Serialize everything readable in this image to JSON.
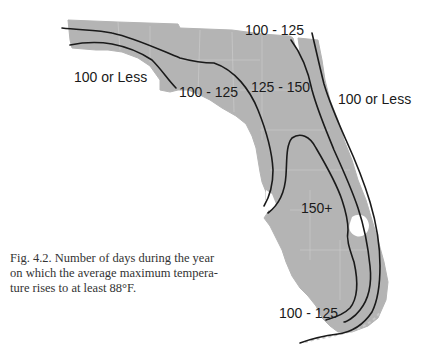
{
  "figure": {
    "caption": "Fig. 4.2. Number of days during the year on which the average maximum temperature rises to at least 88°F.",
    "caption_lines": [
      "Fig. 4.2. Number of days during the year",
      "on which the average maximum tempera-",
      "ture rises to at least 88°F."
    ]
  },
  "map": {
    "region": "Florida",
    "land_color": "#b4b4b4",
    "line_color": "#1a1a1a",
    "zone_labels": [
      {
        "id": "west-100-or-less",
        "text": "100 or Less"
      },
      {
        "id": "panhandle-100-125",
        "text": "100 - 125"
      },
      {
        "id": "north-100-125",
        "text": "100 - 125"
      },
      {
        "id": "central-125-150",
        "text": "125 - 150"
      },
      {
        "id": "east-100-or-less",
        "text": "100 or Less"
      },
      {
        "id": "south-150-plus",
        "text": "150+"
      },
      {
        "id": "south-100-125",
        "text": "100 - 125"
      }
    ]
  }
}
